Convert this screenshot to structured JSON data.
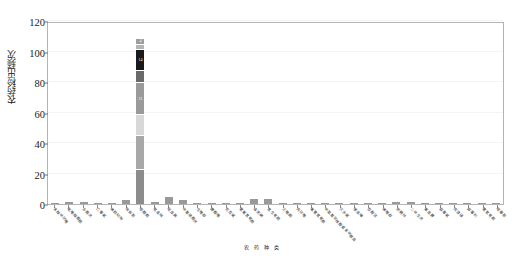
{
  "chart_data": {
    "type": "bar",
    "title": "",
    "subtitle": "",
    "xlabel": "",
    "ylabel": "农药检出频次",
    "ylim": [
      0,
      120
    ],
    "yticks": [
      0,
      20,
      40,
      60,
      80,
      100,
      120
    ],
    "grid": true,
    "legend_position": "none",
    "stacked": true,
    "categories": [
      "苯醚甲环唑",
      "吡唑醚菌酯",
      "多菌灵",
      "乙霉威",
      "烯酰吗啉",
      "咪鲜胺",
      "嘧菌酯",
      "吡虫啉",
      "啶虫脒",
      "甲基硫菌灵",
      "戊唑醇",
      "腈菌唑",
      "克百威",
      "氯氟氰菊酯",
      "毒死蜱",
      "氰戊菊酯",
      "三唑酮",
      "丙环唑",
      "氟氯氰菊酯",
      "甲氨基阿维菌素苯甲酸盐",
      "灭多威",
      "噻虫嗪",
      "百菌清",
      "烯唑醇",
      "炔螨特",
      "二甲戊灵",
      "氟虫腈",
      "霜霉威",
      "丙溴磷",
      "腐霉利",
      "氯氰菊酯",
      "嘧霉胺"
    ],
    "values": [
      1,
      2,
      2,
      1,
      1,
      3,
      109,
      2,
      5,
      3,
      1,
      1,
      1,
      1,
      4,
      4,
      1,
      1,
      1,
      1,
      1,
      1,
      1,
      1,
      2,
      2,
      1,
      1,
      1,
      1,
      1,
      1
    ],
    "stack_segments": [
      {
        "index": 6,
        "segments": [
          {
            "value": 23,
            "color": "#8c8c8c",
            "label": ""
          },
          {
            "value": 22,
            "color": "#a8a8a8",
            "label": ""
          },
          {
            "value": 14,
            "color": "#d8d8d8",
            "label": ""
          },
          {
            "value": 21,
            "color": "#9a9a9a",
            "label": "21"
          },
          {
            "value": 8,
            "color": "#6a6a6a",
            "label": ""
          },
          {
            "value": 14,
            "color": "#1a1a1a",
            "label": "14"
          },
          {
            "value": 3,
            "color": "#b5b5b5",
            "label": ""
          },
          {
            "value": 4,
            "color": "#9e9e9e",
            "label": "4"
          }
        ]
      }
    ],
    "bar_color": "#999999",
    "frame_color": "#b4b4b4",
    "grid_color": "#f4f4f4"
  },
  "caption": "农药种类",
  "axis": {
    "y_title": "农药检出频次"
  }
}
